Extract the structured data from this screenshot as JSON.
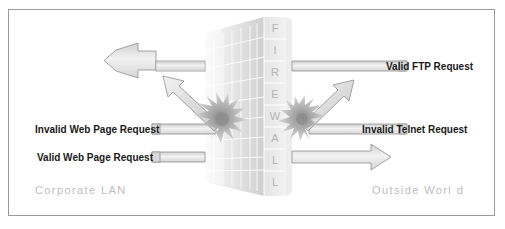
{
  "figure": {
    "type": "network-security-diagram",
    "title_visible": false,
    "border_color": "#9a9a9a",
    "background": "#ffffff"
  },
  "firewall": {
    "name": "firewall-wall",
    "letters": [
      "F",
      "I",
      "R",
      "E",
      "W",
      "A",
      "L",
      "L"
    ],
    "letter_color": "#b4b4b4",
    "brick_light": "#eeeeee",
    "brick_mid": "#e0e0e0",
    "brick_dark": "#d0d0d0",
    "brick_line": "#ffffff"
  },
  "zones": {
    "left": {
      "name": "corporate-lan",
      "caption": "Corporate LAN"
    },
    "right": {
      "name": "outside-world",
      "caption": "Outside Worl d"
    },
    "caption_color": "#bdbdbd"
  },
  "flows": [
    {
      "id": "valid-ftp-request",
      "label": "Valid FTP Request",
      "label_side": "right",
      "direction": "inbound-to-lan",
      "status": "allowed",
      "description": "Passes through firewall and continues left into the LAN"
    },
    {
      "id": "invalid-web-page-request",
      "label": "Invalid Web Page Request",
      "label_side": "left",
      "direction": "outbound-to-internet",
      "status": "blocked",
      "description": "Strikes firewall at impact burst and is deflected back up-left"
    },
    {
      "id": "valid-web-page-request",
      "label": "Valid Web Page Request",
      "label_side": "left",
      "direction": "outbound-to-internet",
      "status": "allowed",
      "description": "Passes through firewall and continues right to the outside world"
    },
    {
      "id": "invalid-telnet-request",
      "label": "Invalid Telnet Request",
      "label_side": "right",
      "direction": "inbound-to-lan",
      "status": "blocked",
      "description": "Strikes firewall at impact burst and is deflected back up-right"
    }
  ],
  "arrow_style": {
    "fill_light": "#f0f0f0",
    "fill_mid": "#d8d8d8",
    "stroke": "#8f8f8f"
  },
  "impact_bursts": [
    {
      "id": "impact-burst-left",
      "side": "left"
    },
    {
      "id": "impact-burst-right",
      "side": "right"
    }
  ]
}
